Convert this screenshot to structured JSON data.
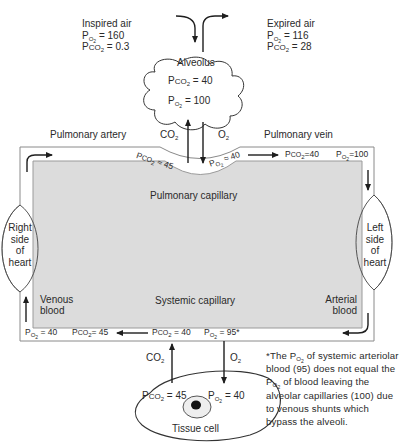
{
  "inspired_air": {
    "title": "Inspired air",
    "po2_label": "P",
    "po2_sub": "O2",
    "po2_value": "= 160",
    "pco2_label": "P",
    "pco2_sub": "CO2",
    "pco2_value": "= 0.3"
  },
  "expired_air": {
    "title": "Expired air",
    "po2_value": "= 116",
    "pco2_value": "= 28"
  },
  "alveolus": {
    "title": "Alveolus",
    "pco2_value": "= 40",
    "po2_value": "= 100"
  },
  "gas_labels": {
    "co2": "CO",
    "o2": "O",
    "sub2": "2"
  },
  "vessels": {
    "pulmonary_artery": "Pulmonary artery",
    "pulmonary_vein": "Pulmonary vein",
    "pulmonary_capillary": "Pulmonary capillary",
    "systemic_capillary": "Systemic capillary",
    "venous_blood_line1": "Venous",
    "venous_blood_line2": "blood",
    "arterial_blood_line1": "Arterial",
    "arterial_blood_line2": "blood"
  },
  "heart": {
    "right": [
      "Right",
      "side",
      "of",
      "heart"
    ],
    "left": [
      "Left",
      "side",
      "of",
      "heart"
    ]
  },
  "pulmonary_values": {
    "capillary_pco2": "≈ 45",
    "capillary_po2": "≈ 40",
    "vein_pco2": "=40",
    "vein_po2": "=100"
  },
  "systemic_values": {
    "venous_po2": "= 40",
    "venous_pco2": "= 45",
    "arterial_pco2": "= 40",
    "arterial_po2": "= 95*"
  },
  "tissue_cell": {
    "title": "Tissue cell",
    "pco2_value": "= 45",
    "po2_value": "= 40"
  },
  "footnote": {
    "marker": "*",
    "text_part1": "The P",
    "text_sub1": "O2",
    "text_part2": " of systemic arteriolar blood (95) does not equal the P",
    "text_sub2": "O2",
    "text_part3": " of blood leaving the alveolar capillaries (100) due to venous shunts which bypass the alveoli."
  },
  "colors": {
    "ink": "#2a2a2a",
    "capillary_fill": "#dcdcdc",
    "background": "#ffffff"
  }
}
